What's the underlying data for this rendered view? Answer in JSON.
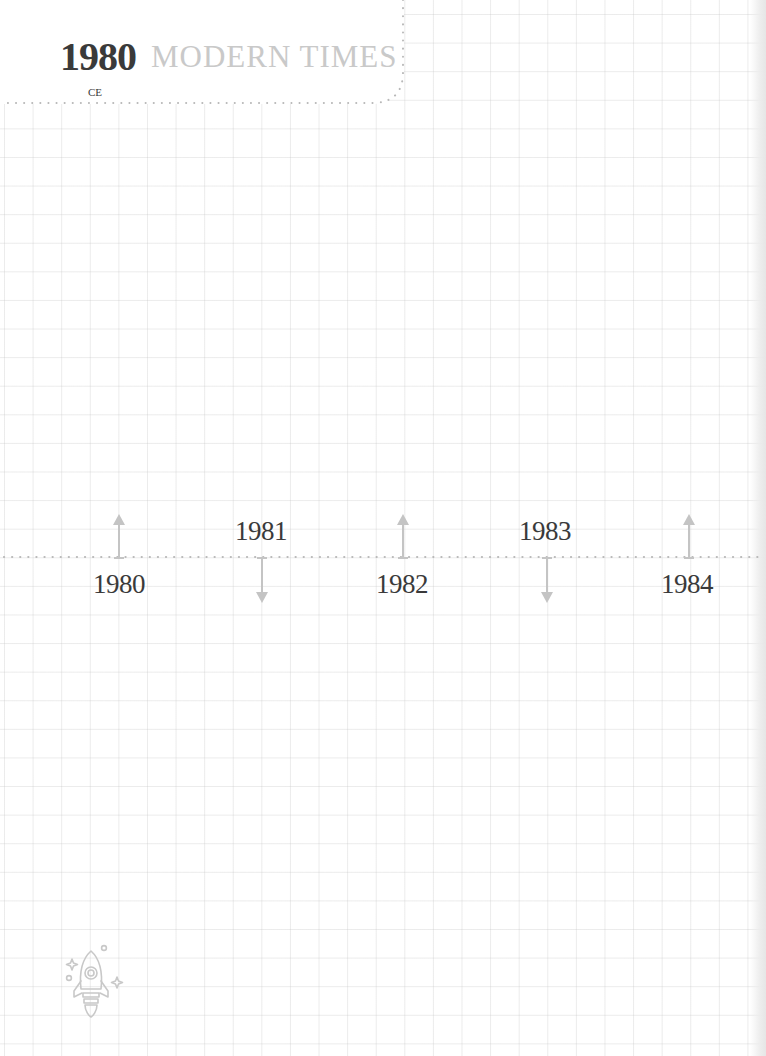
{
  "header": {
    "year": "1980",
    "era": "CE",
    "period": "MODERN TIMES"
  },
  "timeline": {
    "events": [
      {
        "year": "1980",
        "x": 119,
        "direction": "up",
        "label_position": "below"
      },
      {
        "year": "1981",
        "x": 262,
        "direction": "down",
        "label_position": "above"
      },
      {
        "year": "1982",
        "x": 403,
        "direction": "up",
        "label_position": "below"
      },
      {
        "year": "1983",
        "x": 547,
        "direction": "down",
        "label_position": "above"
      },
      {
        "year": "1984",
        "x": 689,
        "direction": "up",
        "label_position": "below"
      }
    ]
  },
  "decoration": {
    "icon": "rocket-icon"
  },
  "colors": {
    "text_dark": "#3a3a3a",
    "text_light": "#c9c9c9",
    "arrow": "#c4c4c4",
    "dots": "#b8b8b8",
    "grid": "#e6e6e6"
  }
}
